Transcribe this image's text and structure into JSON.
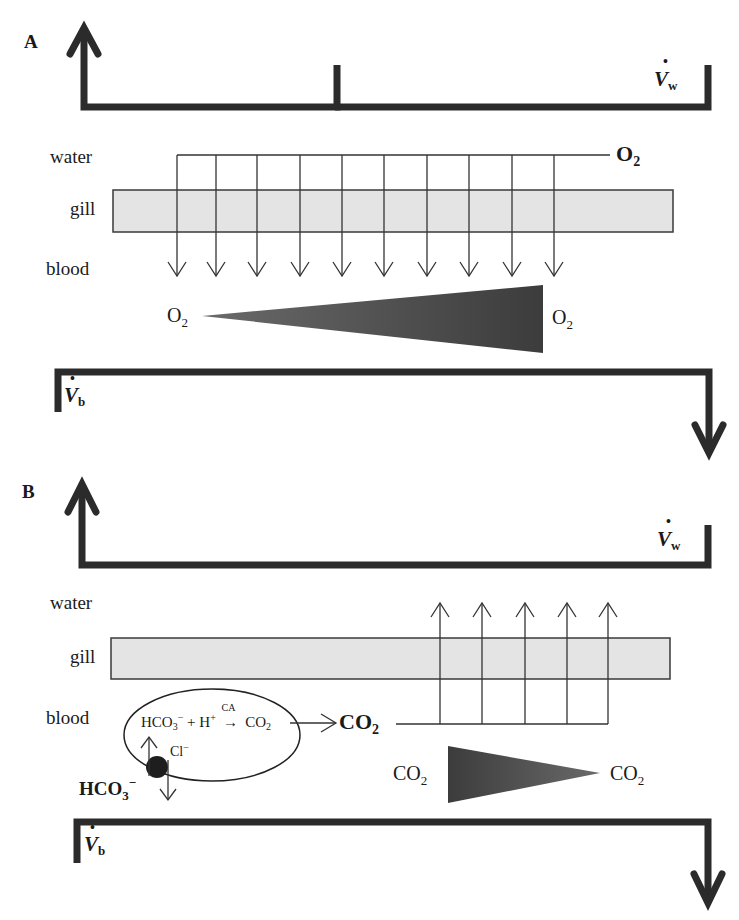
{
  "panels": [
    {
      "id": "A",
      "label": "A",
      "layers": {
        "water": "water",
        "gill": "gill",
        "blood": "blood"
      },
      "water_flow": {
        "symbol": "V",
        "subscript": "w"
      },
      "blood_flow": {
        "symbol": "V",
        "subscript": "b"
      },
      "source_gas": {
        "formula": "O",
        "subscript": "2",
        "bold": true
      },
      "gradient": {
        "left": {
          "formula": "O",
          "subscript": "2"
        },
        "right": {
          "formula": "O",
          "subscript": "2"
        },
        "direction": "increasing to the right"
      },
      "diffusion_arrows": {
        "count": 10,
        "direction": "down"
      }
    },
    {
      "id": "B",
      "label": "B",
      "layers": {
        "water": "water",
        "gill": "gill",
        "blood": "blood"
      },
      "water_flow": {
        "symbol": "V",
        "subscript": "w"
      },
      "blood_flow": {
        "symbol": "V",
        "subscript": "b"
      },
      "red_cell": {
        "reaction": {
          "reactant1": "HCO",
          "reactant1_sub": "3",
          "reactant1_sup": "−",
          "plus": "+",
          "reactant2": "H",
          "reactant2_sup": "+",
          "enzyme": "CA",
          "product": "CO",
          "product_sub": "2"
        },
        "exchanger_ion": {
          "formula": "Cl",
          "sup": "−"
        },
        "external_ion": {
          "formula": "HCO",
          "sub": "3",
          "sup": "−"
        }
      },
      "product_gas": {
        "formula": "CO",
        "subscript": "2",
        "bold": true
      },
      "gradient": {
        "left": {
          "formula": "CO",
          "subscript": "2"
        },
        "right": {
          "formula": "CO",
          "subscript": "2"
        },
        "direction": "decreasing to the right"
      },
      "diffusion_arrows": {
        "count": 5,
        "direction": "up"
      }
    }
  ],
  "colors": {
    "flow_line": "#2b2b2b",
    "gill_fill": "#e4e4e4",
    "gill_stroke": "#3a3a3a",
    "gradient_fill": "#4a4a4a",
    "thin_line": "#333333"
  }
}
